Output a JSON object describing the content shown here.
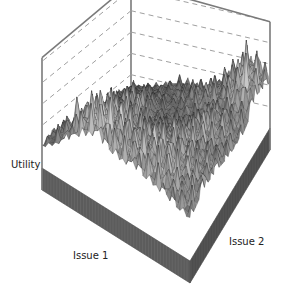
{
  "chart_data": {
    "type": "surface3d",
    "title": "",
    "xlabel": "Issue 1",
    "ylabel": "Issue 2",
    "zlabel": "Utility",
    "grid": true,
    "gridlines_per_wall": 3,
    "x_ticks": [],
    "y_ticks": [],
    "z_ticks": [],
    "legend": null,
    "grid_resolution": [
      12,
      12
    ],
    "z_range": [
      0,
      1
    ],
    "z_values": [
      [
        0.12,
        0.14,
        0.18,
        0.22,
        0.3,
        0.28,
        0.26,
        0.35,
        0.52,
        0.6,
        0.7,
        0.55
      ],
      [
        0.14,
        0.16,
        0.2,
        0.25,
        0.3,
        0.34,
        0.4,
        0.45,
        0.55,
        0.72,
        0.85,
        0.62
      ],
      [
        0.15,
        0.18,
        0.22,
        0.32,
        0.28,
        0.3,
        0.45,
        0.5,
        0.48,
        0.66,
        0.9,
        0.68
      ],
      [
        0.16,
        0.2,
        0.3,
        0.4,
        0.35,
        0.28,
        0.36,
        0.42,
        0.4,
        0.5,
        0.6,
        0.52
      ],
      [
        0.18,
        0.22,
        0.35,
        0.5,
        0.45,
        0.3,
        0.28,
        0.35,
        0.45,
        0.62,
        0.58,
        0.45
      ],
      [
        0.18,
        0.25,
        0.4,
        0.55,
        0.6,
        0.4,
        0.3,
        0.4,
        0.55,
        0.7,
        0.6,
        0.48
      ],
      [
        0.2,
        0.28,
        0.45,
        0.58,
        0.62,
        0.52,
        0.45,
        0.5,
        0.62,
        0.68,
        0.55,
        0.5
      ],
      [
        0.22,
        0.3,
        0.5,
        0.62,
        0.7,
        0.6,
        0.55,
        0.6,
        0.72,
        0.65,
        0.6,
        0.55
      ],
      [
        0.25,
        0.35,
        0.55,
        0.66,
        0.78,
        0.7,
        0.68,
        0.72,
        0.75,
        0.7,
        0.62,
        0.58
      ],
      [
        0.28,
        0.4,
        0.6,
        0.75,
        0.85,
        0.8,
        0.72,
        0.78,
        0.8,
        0.72,
        0.65,
        0.6
      ],
      [
        0.3,
        0.45,
        0.7,
        0.88,
        0.95,
        0.82,
        0.75,
        0.8,
        0.76,
        0.7,
        0.6,
        0.55
      ],
      [
        0.25,
        0.38,
        0.55,
        0.7,
        0.8,
        0.72,
        0.68,
        0.7,
        0.65,
        0.6,
        0.55,
        0.5
      ]
    ]
  },
  "labels": {
    "z_axis": "Utility",
    "x_axis": "Issue 1",
    "y_axis": "Issue 2"
  },
  "colors": {
    "box": "#7a7a7a",
    "gridline": "#a0a0a0",
    "surface_dark": "#3a3a3a",
    "surface_light": "#cfcfcf",
    "base_side": "#5c5c5c"
  }
}
